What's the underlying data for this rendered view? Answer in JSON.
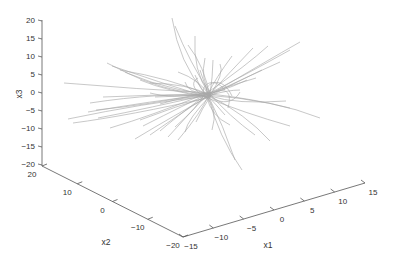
{
  "chart_data": {
    "type": "line3d",
    "title": "",
    "xlabel": "x1",
    "ylabel": "x2",
    "zlabel": "x3",
    "xlim": [
      -15,
      15
    ],
    "ylim": [
      -20,
      20
    ],
    "zlim": [
      -20,
      20
    ],
    "x_ticks": [
      "-15",
      "-10",
      "-5",
      "0",
      "5",
      "10",
      "15"
    ],
    "y_ticks": [
      "20",
      "10",
      "0",
      "-10",
      "-20"
    ],
    "z_ticks": [
      "20",
      "15",
      "10",
      "5",
      "0",
      "-5",
      "-10",
      "-15",
      "-20"
    ],
    "grid": false,
    "legend": null,
    "line_color": "#a8a8a8",
    "axis_color": "#555555"
  },
  "labels": {
    "x1": "x1",
    "x2": "x2",
    "x3": "x3"
  }
}
